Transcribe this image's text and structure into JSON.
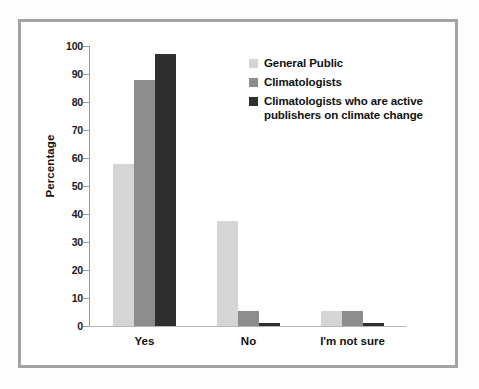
{
  "chart_data": {
    "type": "bar",
    "title": "",
    "subtitle": "",
    "xlabel": "",
    "ylabel": "Percentage",
    "ylim": [
      0,
      100
    ],
    "ytick_labels": [
      "100",
      "90",
      "80",
      "70",
      "60",
      "50",
      "40",
      "30",
      "20",
      "10",
      "0"
    ],
    "ytick_values": [
      100,
      90,
      80,
      70,
      60,
      50,
      40,
      30,
      20,
      10,
      0
    ],
    "grid": false,
    "legend_position": "upper-right-inside",
    "categories": [
      "Yes",
      "No",
      "I'm not sure"
    ],
    "series": [
      {
        "name": "General Public",
        "color": "#d5d5d5",
        "values": [
          58,
          37.5,
          5.5
        ]
      },
      {
        "name": "Climatologists",
        "color": "#8d8d8d",
        "values": [
          88,
          5.5,
          5.5
        ]
      },
      {
        "name": "Climatologists who are active\npublishers on climate change",
        "color": "#2f2f2f",
        "values": [
          97,
          1,
          1
        ]
      }
    ]
  },
  "figure": {
    "frame_color": "#a3a3a3",
    "background": "#ffffff",
    "axis_color": "#9a9a9a"
  }
}
